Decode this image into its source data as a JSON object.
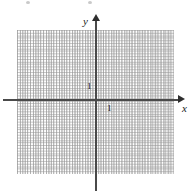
{
  "figure": {
    "kind": "cartesian-coordinate-grid",
    "background_color": "#ffffff",
    "axis_color": "#4a4a4a",
    "grid_color": "#969696",
    "text_color": "#1a1a1a"
  },
  "axes": {
    "x_label": "x",
    "y_label": "y",
    "origin": {
      "x": 96,
      "y": 100
    },
    "x_arrow": "right",
    "y_arrow": "up"
  },
  "ticks": {
    "x_unit_label": "1",
    "y_unit_label": "1"
  },
  "grid": {
    "cell_size_px": 13,
    "columns": 12,
    "rows": 11,
    "style": "dotted",
    "left_px": 17,
    "top_px": 30,
    "width_px": 157,
    "height_px": 144
  },
  "chart_data": {
    "type": "scatter",
    "title": "",
    "xlabel": "x",
    "ylabel": "y",
    "xlim": [
      -6,
      6
    ],
    "ylim": [
      -6,
      5
    ],
    "grid": true,
    "legend": "none",
    "series": [],
    "x": [],
    "values": [],
    "annotations": [
      "1",
      "1"
    ]
  }
}
